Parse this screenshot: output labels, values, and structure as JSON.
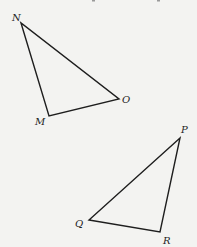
{
  "diagram": {
    "background": "#f3f3f1",
    "stroke_color": "#1e1e1e",
    "triangles": [
      {
        "name": "MNO",
        "vertices": [
          {
            "label": "N",
            "x": 21,
            "y": 23,
            "label_x": 12,
            "label_y": 21
          },
          {
            "label": "M",
            "x": 49,
            "y": 116,
            "label_x": 35,
            "label_y": 125
          },
          {
            "label": "O",
            "x": 119,
            "y": 99,
            "label_x": 122,
            "label_y": 103
          }
        ]
      },
      {
        "name": "PQR",
        "vertices": [
          {
            "label": "P",
            "x": 180,
            "y": 138,
            "label_x": 181,
            "label_y": 133
          },
          {
            "label": "Q",
            "x": 89,
            "y": 220,
            "label_x": 75,
            "label_y": 227
          },
          {
            "label": "R",
            "x": 160,
            "y": 232,
            "label_x": 163,
            "label_y": 244
          }
        ]
      }
    ]
  }
}
